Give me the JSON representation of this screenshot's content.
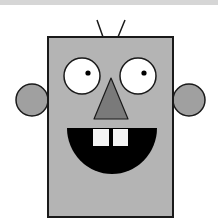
{
  "image": {
    "subject": "cartoon robot face",
    "description": "Gray rectangular robot head with two antennae, round white eyes with black pupils, triangular nose, side ear circles, and a black semicircle mouth with two white teeth"
  },
  "colors": {
    "background": "#ffffff",
    "top_bar": "#d6d6d6",
    "head": "#b4b4b4",
    "ears": "#a0a0a0",
    "nose": "#7a7a7a",
    "outline": "#1a1a1a",
    "eye_white": "#ffffff",
    "pupil": "#000000",
    "mouth": "#000000",
    "teeth": "#f4f4f4"
  },
  "shapes": {
    "head": {
      "x": 48,
      "y": 37,
      "width": 125,
      "height": 180
    },
    "antenna_left": {
      "x1": 97,
      "y1": 20,
      "x2": 103,
      "y2": 37
    },
    "antenna_right": {
      "x1": 125,
      "y1": 20,
      "x2": 118,
      "y2": 37
    },
    "eye_left": {
      "cx": 82,
      "cy": 76,
      "r": 18,
      "pupil_cx": 88,
      "pupil_cy": 73,
      "pupil_r": 2.6
    },
    "eye_right": {
      "cx": 138,
      "cy": 76,
      "r": 18,
      "pupil_cx": 144,
      "pupil_cy": 73,
      "pupil_r": 2.6
    },
    "nose": {
      "points": "111,78 94,119 128,119"
    },
    "ear_left": {
      "cx": 32,
      "cy": 100,
      "r": 16
    },
    "ear_right": {
      "cx": 189,
      "cy": 100,
      "r": 16
    },
    "mouth": {
      "cx": 112,
      "top": 128,
      "rx": 45,
      "ry": 46
    },
    "tooth_left": {
      "x": 93,
      "y": 129,
      "width": 16,
      "height": 17
    },
    "tooth_right": {
      "x": 113,
      "y": 129,
      "width": 15,
      "height": 17
    }
  }
}
